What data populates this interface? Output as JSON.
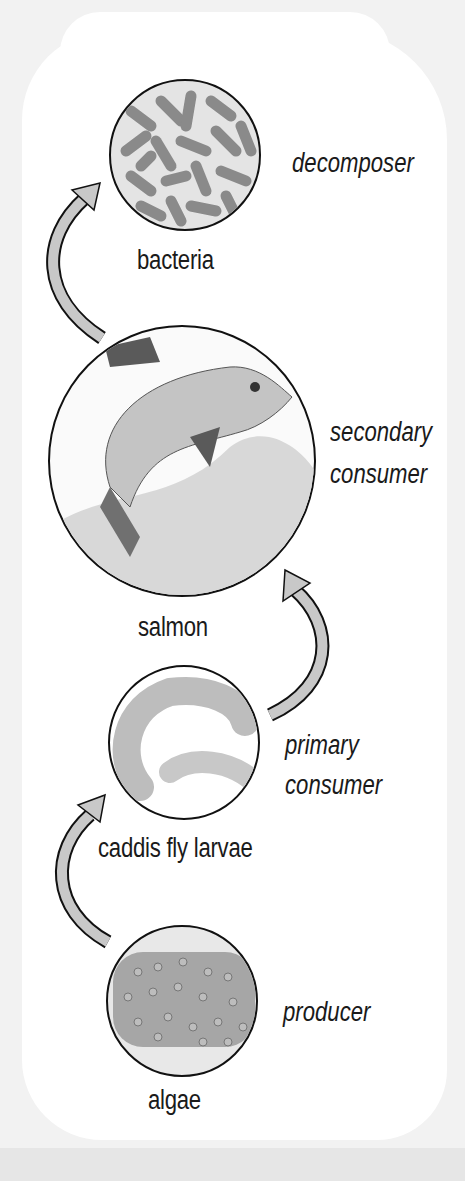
{
  "diagram": {
    "type": "food-chain",
    "direction": "bottom-to-top",
    "levels": [
      {
        "organism": "bacteria",
        "role": "decomposer",
        "icon": "bacteria-icon"
      },
      {
        "organism": "salmon",
        "role_line1": "secondary",
        "role_line2": "consumer",
        "icon": "salmon-icon"
      },
      {
        "organism": "caddis fly larvae",
        "role_line1": "primary",
        "role_line2": "consumer",
        "icon": "caddis-fly-larvae-icon"
      },
      {
        "organism": "algae",
        "role": "producer",
        "icon": "algae-icon"
      }
    ],
    "arrows": [
      {
        "from": "algae",
        "to": "caddis fly larvae"
      },
      {
        "from": "caddis fly larvae",
        "to": "salmon"
      },
      {
        "from": "salmon",
        "to": "bacteria"
      }
    ],
    "colors": {
      "background": "#f2f2f2",
      "panel": "#ffffff",
      "arrow_fill": "#c8c8c8",
      "outline": "#111111",
      "text": "#1a1a1a"
    }
  }
}
